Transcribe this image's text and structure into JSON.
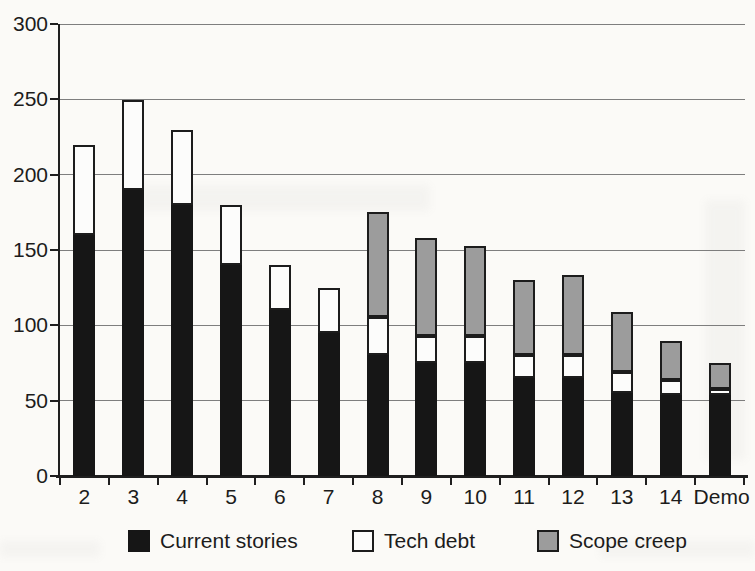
{
  "chart_data": {
    "type": "bar",
    "variant": "stacked-vertical-column",
    "title": "",
    "xlabel": "",
    "ylabel": "",
    "categories": [
      "2",
      "3",
      "4",
      "5",
      "6",
      "7",
      "8",
      "9",
      "10",
      "11",
      "12",
      "13",
      "14",
      "Demo"
    ],
    "series": [
      {
        "name": "Current stories",
        "color": "#161616",
        "outlined": false,
        "values": [
          160,
          190,
          180,
          140,
          110,
          95,
          80,
          75,
          75,
          65,
          65,
          55,
          54,
          54
        ]
      },
      {
        "name": "Tech debt",
        "color": "#fcfcfb",
        "outlined": true,
        "values": [
          60,
          60,
          50,
          40,
          30,
          30,
          25,
          18,
          18,
          15,
          15,
          14,
          10,
          4
        ]
      },
      {
        "name": "Scope creep",
        "color": "#9c9c9c",
        "outlined": true,
        "values": [
          0,
          0,
          0,
          0,
          0,
          0,
          70,
          65,
          60,
          50,
          53,
          40,
          26,
          17
        ]
      }
    ],
    "stacked_totals": [
      220,
      250,
      230,
      180,
      140,
      125,
      175,
      158,
      153,
      130,
      133,
      109,
      90,
      75
    ],
    "ylim": [
      0,
      300
    ],
    "ytick_interval": 50,
    "ytick_labels": [
      "0",
      "50",
      "100",
      "150",
      "200",
      "250",
      "300"
    ],
    "grid": true,
    "gridline_color": "#707070",
    "axis_color": "#1f1f1f",
    "text_color": "#1c1c1c",
    "legend_position": "bottom"
  }
}
